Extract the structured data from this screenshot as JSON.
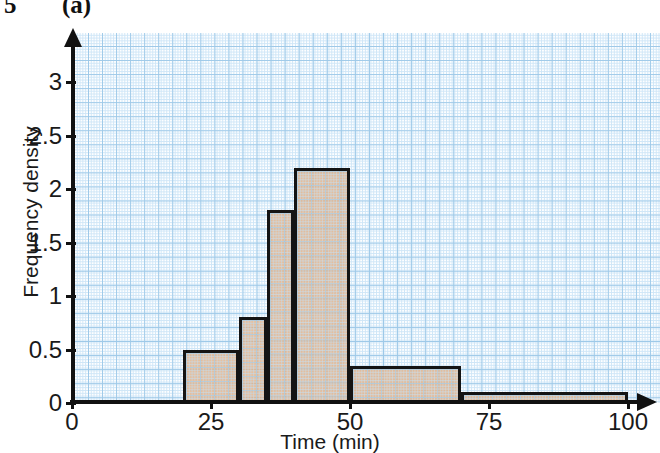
{
  "header": {
    "question_number": "5",
    "part_label": "(a)"
  },
  "chart_data": {
    "type": "bar",
    "title": "",
    "subtitle": "",
    "xlabel": "Time (min)",
    "ylabel": "Frequency density",
    "xlim": [
      0,
      100
    ],
    "ylim": [
      0,
      3.3
    ],
    "xticks": [
      "0",
      "25",
      "50",
      "75",
      "100"
    ],
    "xtick_values": [
      0,
      25,
      50,
      75,
      100
    ],
    "yticks": [
      "0",
      "0.5",
      "1",
      "1.5",
      "2",
      "2.5",
      "3"
    ],
    "ytick_values": [
      0,
      0.5,
      1,
      1.5,
      2,
      2.5,
      3
    ],
    "grid": true,
    "grid_style": "graph-paper",
    "legend": "none",
    "bar_fill_color": "#e2b28a",
    "bar_edge_color": "#141414",
    "grid_major_color": "#9ec9e8",
    "grid_minor_color": "#cfe6f7",
    "bins": [
      {
        "start": 20,
        "end": 30,
        "frequency_density": 0.5
      },
      {
        "start": 30,
        "end": 35,
        "frequency_density": 0.8
      },
      {
        "start": 35,
        "end": 40,
        "frequency_density": 1.8
      },
      {
        "start": 40,
        "end": 50,
        "frequency_density": 2.2
      },
      {
        "start": 50,
        "end": 70,
        "frequency_density": 0.35
      },
      {
        "start": 70,
        "end": 100,
        "frequency_density": 0.1
      }
    ]
  }
}
